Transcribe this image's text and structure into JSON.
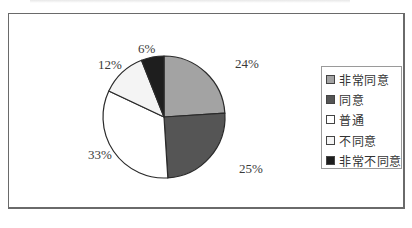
{
  "chart_data": {
    "type": "pie",
    "title": "",
    "start_angle_deg": 0,
    "direction": "clockwise",
    "categories": [
      "非常同意",
      "同意",
      "普通",
      "不同意",
      "非常不同意"
    ],
    "values": [
      24,
      25,
      33,
      12,
      6
    ],
    "labels": [
      "24%",
      "25%",
      "33%",
      "12%",
      "6%"
    ],
    "colors": [
      "#a3a3a3",
      "#555555",
      "#ffffff",
      "#f4f4f4",
      "#1e1e1e"
    ],
    "legend_position": "right",
    "grid": false
  },
  "legend": {
    "items": [
      {
        "label": "非常同意",
        "color": "#a3a3a3"
      },
      {
        "label": "同意",
        "color": "#555555"
      },
      {
        "label": "普通",
        "color": "#ffffff"
      },
      {
        "label": "不同意",
        "color": "#f4f4f4"
      },
      {
        "label": "非常不同意",
        "color": "#1e1e1e"
      }
    ]
  }
}
